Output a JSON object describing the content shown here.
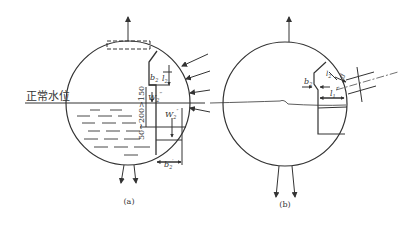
{
  "figure": {
    "panel_a": {
      "caption": "(a)",
      "water_level_label": "正常水位",
      "dimension_labels": {
        "b2": "b",
        "b2_sub": "2",
        "l2": "l",
        "l2_sub": "2",
        "w2_triple": "W",
        "w2_triple_sub": "2",
        "w2_triple_sup": "‴",
        "w2_double": "W",
        "w2_double_sub": "2",
        "w2_double_sup": "″",
        "b2_prime": "b",
        "b2_prime_sub": "2",
        "b2_prime_sup": "′",
        "vertical_dim": "50~200>150"
      }
    },
    "panel_b": {
      "caption": "(b)",
      "dimension_labels": {
        "b2": "b",
        "b2_sub": "2",
        "l2": "l",
        "l2_sub": "2",
        "l1": "l",
        "l1_sub": "1",
        "d": "d",
        "r": "r"
      }
    }
  }
}
